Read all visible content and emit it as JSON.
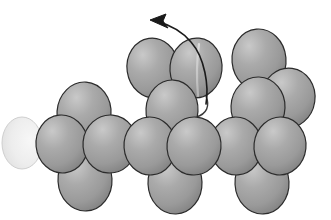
{
  "figure": {
    "title": "Space-filling model of a chain molecule",
    "kind": "molecular-space-filling-diagram",
    "caption": "",
    "background_color": "#ffffff",
    "canvas": {
      "width": 331,
      "height": 220
    }
  },
  "style": {
    "sphere_fill_light": "#c3c3c3",
    "sphere_fill_mid": "#9a9a9a",
    "sphere_fill_dark": "#7d7d7d",
    "sphere_outline": "#2b2b2b",
    "sphere_outline_width": 1.2,
    "backbone_color": "#4a4a4a",
    "backbone_width": 1.6,
    "arrow_color": "#1a1a1a",
    "arrow_width": 1.6,
    "ghost_fill": "#e9e9e9",
    "ghost_outline": "#cfcfcf"
  },
  "backbone": {
    "label": "chain backbone line",
    "y": 148,
    "x_start": 22,
    "x_end": 305
  },
  "ghost_atom": {
    "label": "faded continuation atom",
    "cx": 22,
    "cy": 143,
    "rx": 20,
    "ry": 26,
    "note": "chain continues off-frame to the left"
  },
  "clusters": [
    {
      "name": "left-cluster",
      "atoms": [
        {
          "id": "L-backbone",
          "label": "backbone atom left",
          "cx": 62,
          "cy": 144,
          "rx": 26,
          "ry": 29,
          "rot": -6,
          "z": 3
        },
        {
          "id": "L-top",
          "label": "upper atom left",
          "cx": 84,
          "cy": 113,
          "rx": 27,
          "ry": 31,
          "rot": 4,
          "z": 1
        },
        {
          "id": "L-right",
          "label": "backbone atom left-2",
          "cx": 110,
          "cy": 144,
          "rx": 27,
          "ry": 29,
          "rot": 5,
          "z": 4
        },
        {
          "id": "L-bottom",
          "label": "lower atom left",
          "cx": 85,
          "cy": 180,
          "rx": 27,
          "ry": 31,
          "rot": -3,
          "z": 2
        }
      ]
    },
    {
      "name": "middle-cluster",
      "atoms": [
        {
          "id": "M-upperleft",
          "label": "upper-left atom middle",
          "cx": 153,
          "cy": 68,
          "rx": 26,
          "ry": 30,
          "rot": -8,
          "z": 1
        },
        {
          "id": "M-uppermid",
          "label": "rotating atom middle",
          "cx": 196,
          "cy": 68,
          "rx": 26,
          "ry": 30,
          "rot": 6,
          "z": 2
        },
        {
          "id": "M-stack",
          "label": "mid atom middle",
          "cx": 172,
          "cy": 110,
          "rx": 26,
          "ry": 30,
          "rot": 3,
          "z": 3
        },
        {
          "id": "M-backbone1",
          "label": "backbone atom middle-1",
          "cx": 150,
          "cy": 146,
          "rx": 26,
          "ry": 29,
          "rot": -4,
          "z": 4
        },
        {
          "id": "M-backbone2",
          "label": "backbone atom middle-2",
          "cx": 194,
          "cy": 146,
          "rx": 27,
          "ry": 29,
          "rot": 5,
          "z": 5
        },
        {
          "id": "M-bottom",
          "label": "lower atom middle",
          "cx": 175,
          "cy": 183,
          "rx": 27,
          "ry": 31,
          "rot": -2,
          "z": 2
        }
      ]
    },
    {
      "name": "right-cluster",
      "atoms": [
        {
          "id": "R-topleft",
          "label": "upper atom right",
          "cx": 259,
          "cy": 60,
          "rx": 27,
          "ry": 31,
          "rot": -5,
          "z": 1
        },
        {
          "id": "R-topright",
          "label": "upper-right atom right",
          "cx": 288,
          "cy": 98,
          "rx": 27,
          "ry": 30,
          "rot": 8,
          "z": 2
        },
        {
          "id": "R-stack",
          "label": "mid atom right",
          "cx": 258,
          "cy": 107,
          "rx": 27,
          "ry": 30,
          "rot": 2,
          "z": 3
        },
        {
          "id": "R-backbone1",
          "label": "backbone atom right-1",
          "cx": 236,
          "cy": 146,
          "rx": 26,
          "ry": 29,
          "rot": -4,
          "z": 4
        },
        {
          "id": "R-backbone2",
          "label": "backbone atom right-2",
          "cx": 280,
          "cy": 146,
          "rx": 26,
          "ry": 29,
          "rot": 6,
          "z": 5
        },
        {
          "id": "R-bottom",
          "label": "lower atom right",
          "cx": 262,
          "cy": 183,
          "rx": 27,
          "ry": 31,
          "rot": -3,
          "z": 2
        }
      ]
    }
  ],
  "annotations": {
    "rotation_arrow": {
      "label": "rotation arrow",
      "description": "curved arrow pointing up and to the left",
      "path": "M 206 104 C 209 86, 205 58, 191 42 C 181 30, 167 24, 156 21",
      "head_tip": {
        "x": 150,
        "y": 20
      },
      "head_points": "150,20 166,14 163,21 168,28",
      "direction": "up-left"
    },
    "hidden_bond_curve": {
      "label": "bond curve behind atom",
      "description": "thin curve running from behind the rotating atom down to the backbone",
      "path": "M 200 46 C 200 62, 201 82, 206 96 C 210 106, 207 114, 196 117"
    },
    "atom_seam": {
      "label": "atom seam highlight",
      "description": "vertical seam line drawn on the rotating atom",
      "path": "M 199 44 C 197 58, 196 74, 198 96"
    }
  }
}
